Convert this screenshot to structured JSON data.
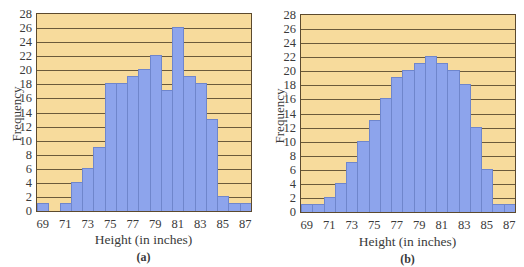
{
  "chart_data": [
    {
      "type": "bar",
      "title": "",
      "caption": "(a)",
      "xlabel": "Height (in inches)",
      "ylabel": "Frequency",
      "ylim": [
        0,
        28
      ],
      "grid": true,
      "yticks": [
        0,
        2,
        4,
        6,
        8,
        10,
        12,
        14,
        16,
        18,
        20,
        22,
        24,
        26,
        28
      ],
      "xtick_labels": [
        "69",
        "71",
        "73",
        "75",
        "77",
        "79",
        "81",
        "83",
        "85",
        "87"
      ],
      "categories": [
        69,
        70,
        71,
        72,
        73,
        74,
        75,
        76,
        77,
        78,
        79,
        80,
        81,
        82,
        83,
        84,
        85,
        86,
        87
      ],
      "values": [
        1,
        0,
        1,
        4,
        6,
        9,
        18,
        18,
        19,
        20,
        22,
        17,
        26,
        19,
        18,
        13,
        2,
        1,
        1
      ]
    },
    {
      "type": "bar",
      "title": "",
      "caption": "(b)",
      "xlabel": "Height (in inches)",
      "ylabel": "Frequency",
      "ylim": [
        0,
        28
      ],
      "grid": true,
      "yticks": [
        0,
        2,
        4,
        6,
        8,
        10,
        12,
        14,
        16,
        18,
        20,
        22,
        24,
        26,
        28
      ],
      "xtick_labels": [
        "69",
        "71",
        "73",
        "75",
        "77",
        "79",
        "81",
        "83",
        "85",
        "87"
      ],
      "categories": [
        69,
        70,
        71,
        72,
        73,
        74,
        75,
        76,
        77,
        78,
        79,
        80,
        81,
        82,
        83,
        84,
        85,
        86,
        87
      ],
      "values": [
        1,
        1,
        2,
        4,
        7,
        10,
        13,
        16,
        19,
        20,
        21,
        22,
        21,
        20,
        18,
        12,
        6,
        1,
        1
      ]
    }
  ],
  "colors": {
    "plot_background": "#f7db9c",
    "bar_fill": "#8da4ec",
    "bar_edge": "#6f86cc",
    "gridline": "#6b5a3a"
  }
}
